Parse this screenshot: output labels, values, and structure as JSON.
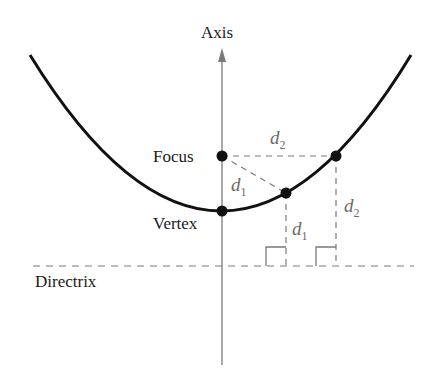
{
  "diagram": {
    "labels": {
      "axis": "Axis",
      "focus": "Focus",
      "vertex": "Vertex",
      "directrix": "Directrix"
    },
    "distances": [
      {
        "name": "d",
        "subscript": "1"
      },
      {
        "name": "d",
        "subscript": "2"
      }
    ],
    "colors": {
      "curve": "#111111",
      "axis": "#7a7a7a",
      "dashed": "#7a7a7a",
      "distance_label": "#6b6b6b"
    }
  }
}
